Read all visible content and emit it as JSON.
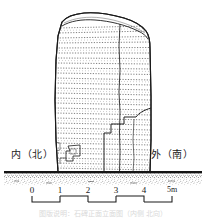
{
  "figure": {
    "kind": "archaeological-elevation-drawing",
    "background_color": "#ffffff",
    "ink_color": "#1a1a1a"
  },
  "labels": {
    "left": "内（北）",
    "right": "外（南）"
  },
  "scalebar": {
    "ticks": [
      "0",
      "1",
      "2",
      "3",
      "4",
      "5m"
    ],
    "unit": "m",
    "min": 0,
    "max": 5,
    "x_start_px": 32,
    "x_end_px": 172,
    "baseline_y_px": 200
  },
  "stone": {
    "outline_left_px": 55,
    "outline_right_px": 152,
    "top_px": 14,
    "ground_px": 172,
    "inscription_rows": 28,
    "has_vertical_seam": true,
    "has_lower_crack": true,
    "has_small_damage_mark": true
  },
  "ground": {
    "line_y_px": 172,
    "soil_band_height_px": 12,
    "stipple": true
  },
  "caption": {
    "text": "图版说明：石碑正面立面图（内侧 北向）"
  },
  "chart_data": {
    "type": "table",
    "categories": [
      "0",
      "1",
      "2",
      "3",
      "4",
      "5m"
    ],
    "values": [
      0,
      1,
      2,
      3,
      4,
      5
    ],
    "xlabel": "meters",
    "ylabel": ""
  }
}
